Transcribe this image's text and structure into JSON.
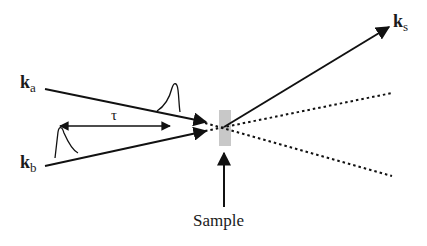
{
  "diagram": {
    "beams": {
      "ka": {
        "label": "k",
        "subscript": "a"
      },
      "kb": {
        "label": "k",
        "subscript": "b"
      },
      "ks": {
        "label": "k",
        "subscript": "s"
      }
    },
    "delay_label": "τ",
    "sample_label": "Sample",
    "colors": {
      "line": "#111111",
      "sample": "#c8c8c8"
    }
  }
}
